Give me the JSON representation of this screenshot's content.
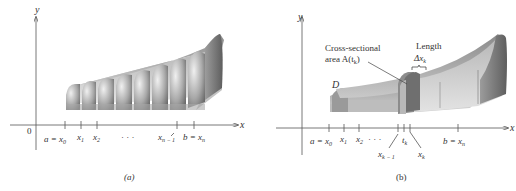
{
  "panel_a": {
    "caption": "(a)",
    "axes": {
      "x_label": "x",
      "y_label": "y",
      "origin_label": "0"
    },
    "ticks": [
      {
        "main": "a = x",
        "sub": "0"
      },
      {
        "main": "x",
        "sub": "1"
      },
      {
        "main": "x",
        "sub": "2"
      },
      {
        "main": "· · ·",
        "sub": ""
      },
      {
        "main": "x",
        "sub": "n − 1"
      },
      {
        "main": "b = x",
        "sub": "n"
      }
    ],
    "slab_count": 8
  },
  "panel_b": {
    "caption": "(b)",
    "axes": {
      "x_label": "x",
      "y_label": "y"
    },
    "ticks": [
      {
        "main": "a = x",
        "sub": "0"
      },
      {
        "main": "x",
        "sub": "1"
      },
      {
        "main": "x",
        "sub": "2"
      },
      {
        "main": "· · ·",
        "sub": ""
      },
      {
        "main": "x",
        "sub": "k − 1"
      },
      {
        "main": "t",
        "sub": "k"
      },
      {
        "main": "x",
        "sub": "k"
      },
      {
        "main": "b = x",
        "sub": "n"
      }
    ],
    "annotations": {
      "cross_section_line1": "Cross-sectional",
      "cross_section_line2_prefix": "area A(t",
      "cross_section_line2_sub": "k",
      "cross_section_line2_suffix": ")",
      "length_line1": "Length",
      "length_line2_main": "Δx",
      "length_line2_sub": "k",
      "solid_label": "D"
    }
  },
  "colors": {
    "axis": "#555555",
    "solid_dark": "#6e6e6e",
    "solid_mid": "#9a9a9a",
    "solid_light": "#d8d8d8",
    "text": "#333333"
  }
}
